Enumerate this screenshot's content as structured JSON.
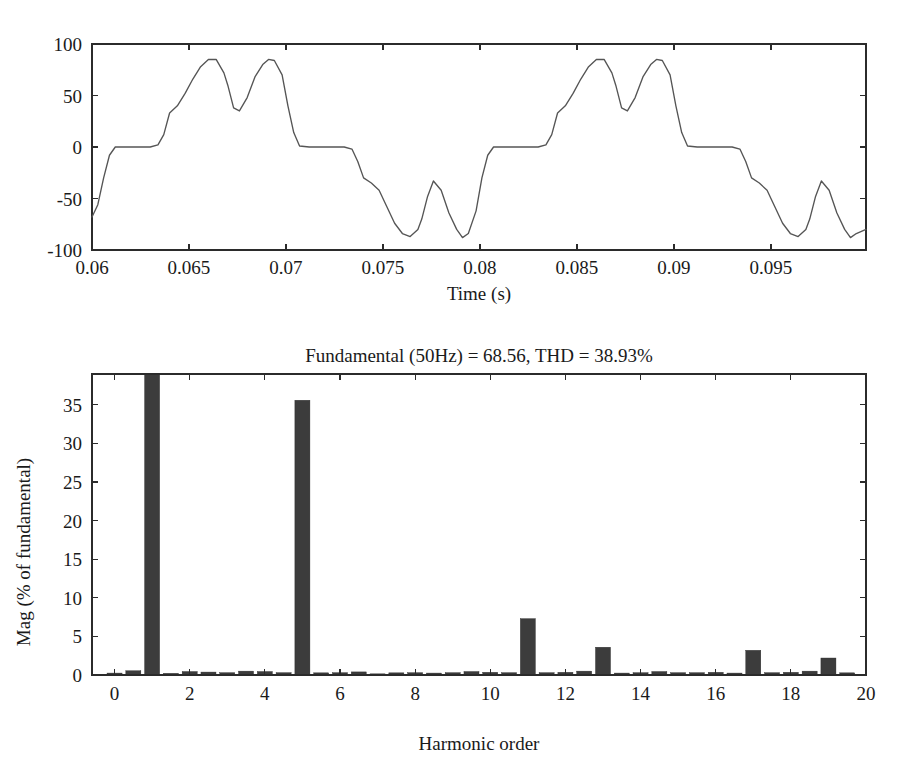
{
  "figure": {
    "background": "#ffffff",
    "line_color": "#555555",
    "bar_color": "#3c3c3c",
    "axis_color": "#2b2b2b"
  },
  "chart_data": [
    {
      "type": "line",
      "id": "waveform",
      "title": "",
      "xlabel": "Time (s)",
      "ylabel": "",
      "xlim": [
        0.06,
        0.0999
      ],
      "ylim": [
        -100,
        100
      ],
      "xticks": [
        0.06,
        0.065,
        0.07,
        0.075,
        0.08,
        0.085,
        0.09,
        0.095
      ],
      "xtick_labels": [
        "0.06",
        "0.065",
        "0.07",
        "0.075",
        "0.08",
        "0.085",
        "0.09",
        "0.095"
      ],
      "yticks": [
        -100,
        -50,
        0,
        50,
        100
      ],
      "ytick_labels": [
        "-100",
        "-50",
        "0",
        "50",
        "100"
      ],
      "grid": false,
      "legend": "none",
      "series": [
        {
          "name": "Phase voltage",
          "x": [
            0.06,
            0.0603,
            0.0606,
            0.0609,
            0.0612,
            0.062,
            0.063,
            0.0634,
            0.0637,
            0.064,
            0.0644,
            0.0648,
            0.0652,
            0.0656,
            0.066,
            0.0664,
            0.0668,
            0.067,
            0.0673,
            0.0676,
            0.068,
            0.0684,
            0.0688,
            0.0691,
            0.0694,
            0.0698,
            0.0701,
            0.0704,
            0.0707,
            0.0712,
            0.072,
            0.073,
            0.0734,
            0.0737,
            0.074,
            0.0744,
            0.0748,
            0.0752,
            0.0756,
            0.076,
            0.0764,
            0.0768,
            0.077,
            0.0773,
            0.0776,
            0.078,
            0.0784,
            0.0788,
            0.0791,
            0.0794,
            0.0798,
            0.0801,
            0.0804,
            0.0807,
            0.0812,
            0.082,
            0.083,
            0.0834,
            0.0837,
            0.084,
            0.0844,
            0.0848,
            0.0852,
            0.0856,
            0.086,
            0.0864,
            0.0868,
            0.087,
            0.0873,
            0.0876,
            0.088,
            0.0884,
            0.0888,
            0.0891,
            0.0894,
            0.0898,
            0.0901,
            0.0904,
            0.0907,
            0.0912,
            0.092,
            0.093,
            0.0934,
            0.0937,
            0.094,
            0.0944,
            0.0948,
            0.0952,
            0.0956,
            0.096,
            0.0964,
            0.0968,
            0.097,
            0.0973,
            0.0976,
            0.098,
            0.0984,
            0.0988,
            0.0991,
            0.0994,
            0.0999
          ],
          "y": [
            -68,
            -56,
            -30,
            -8,
            0,
            0,
            0,
            2,
            12,
            33,
            40,
            52,
            66,
            78,
            85,
            85,
            72,
            60,
            38,
            35,
            48,
            68,
            80,
            85,
            84,
            70,
            40,
            14,
            1,
            0,
            0,
            0,
            -2,
            -14,
            -30,
            -35,
            -42,
            -58,
            -74,
            -84,
            -87,
            -80,
            -70,
            -48,
            -33,
            -42,
            -64,
            -80,
            -88,
            -84,
            -62,
            -30,
            -8,
            0,
            0,
            0,
            0,
            2,
            12,
            33,
            40,
            52,
            66,
            78,
            85,
            85,
            72,
            60,
            38,
            35,
            48,
            68,
            80,
            85,
            84,
            70,
            40,
            14,
            1,
            0,
            0,
            0,
            -2,
            -14,
            -30,
            -35,
            -42,
            -58,
            -74,
            -84,
            -87,
            -80,
            -70,
            -48,
            -33,
            -42,
            -64,
            -80,
            -88,
            -84,
            -80
          ]
        }
      ]
    },
    {
      "type": "bar",
      "id": "harmonic-spectrum",
      "title": "Fundamental (50Hz) = 68.56, THD = 38.93%",
      "title_parts": {
        "fundamental_frequency": "50Hz",
        "fundamental_value": "68.56",
        "thd_value": "38.93%"
      },
      "xlabel": "Harmonic order",
      "ylabel": "Mag (% of fundamental)",
      "xlim": [
        -0.6,
        20
      ],
      "ylim": [
        0,
        39
      ],
      "xticks": [
        0,
        2,
        4,
        6,
        8,
        10,
        12,
        14,
        16,
        18,
        20
      ],
      "xtick_labels": [
        "0",
        "2",
        "4",
        "6",
        "8",
        "10",
        "12",
        "14",
        "16",
        "18",
        "20"
      ],
      "yticks": [
        0,
        5,
        10,
        15,
        20,
        25,
        30,
        35
      ],
      "ytick_labels": [
        "0",
        "5",
        "10",
        "15",
        "20",
        "25",
        "30",
        "35"
      ],
      "grid": false,
      "legend": "none",
      "note": "Fundamental bar (order 1) is clipped at 100% by the axis limit of 39",
      "categories": [
        0,
        0.5,
        1,
        1.5,
        2,
        2.5,
        3,
        3.5,
        4,
        4.5,
        5,
        5.5,
        6,
        6.5,
        7,
        7.5,
        8,
        8.5,
        9,
        9.5,
        10,
        10.5,
        11,
        11.5,
        12,
        12.5,
        13,
        13.5,
        14,
        14.5,
        15,
        15.5,
        16,
        16.5,
        17,
        17.5,
        18,
        18.5,
        19,
        19.5
      ],
      "values": [
        0.25,
        0.55,
        100.0,
        0.22,
        0.45,
        0.38,
        0.3,
        0.5,
        0.45,
        0.3,
        35.6,
        0.28,
        0.3,
        0.4,
        0.15,
        0.28,
        0.3,
        0.25,
        0.3,
        0.45,
        0.35,
        0.3,
        7.3,
        0.3,
        0.35,
        0.5,
        3.6,
        0.25,
        0.3,
        0.45,
        0.3,
        0.3,
        0.35,
        0.25,
        3.2,
        0.3,
        0.35,
        0.5,
        2.2,
        0.28
      ]
    }
  ]
}
